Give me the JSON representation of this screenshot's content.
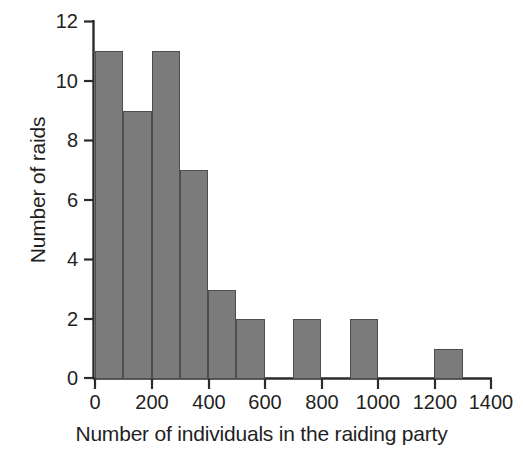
{
  "chart_data": {
    "type": "bar",
    "title": "",
    "subtitle": "",
    "xlabel": "Number of individuals in the raiding party",
    "ylabel": "Number of raids",
    "bin_width": 100,
    "bin_starts": [
      0,
      100,
      200,
      300,
      400,
      500,
      600,
      700,
      800,
      900,
      1000,
      1100,
      1200,
      1300
    ],
    "categories": [
      "0-100",
      "100-200",
      "200-300",
      "300-400",
      "400-500",
      "500-600",
      "600-700",
      "700-800",
      "800-900",
      "900-1000",
      "1000-1100",
      "1100-1200",
      "1200-1300",
      "1300-1400"
    ],
    "values": [
      11,
      9,
      11,
      7,
      3,
      2,
      0,
      2,
      0,
      2,
      0,
      0,
      1,
      0
    ],
    "xlim": [
      0,
      1400
    ],
    "ylim": [
      0,
      12
    ],
    "xticks": [
      0,
      200,
      400,
      600,
      800,
      1000,
      1200,
      1400
    ],
    "xtick_labels": [
      "0",
      "200",
      "400",
      "600",
      "800",
      "1000",
      "1200",
      "1400"
    ],
    "yticks": [
      0,
      2,
      4,
      6,
      8,
      10,
      12
    ],
    "ytick_labels": [
      "0",
      "2",
      "4",
      "6",
      "8",
      "10",
      "12"
    ],
    "grid": false,
    "legend": null,
    "bar_color": "#7b7b7b",
    "bar_edge_color": "#4d4d4d",
    "axis_color": "#2b2b2b",
    "background_color": "#ffffff"
  }
}
